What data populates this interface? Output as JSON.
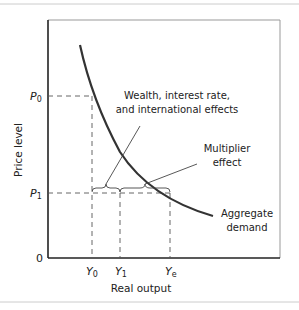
{
  "figure": {
    "y_axis_label": "Price level",
    "x_axis_label": "Real output",
    "origin_label": "0",
    "price_ticks": [
      {
        "main": "P",
        "sub": "0"
      },
      {
        "main": "P",
        "sub": "1"
      }
    ],
    "output_ticks": [
      {
        "main": "Y",
        "sub": "0"
      },
      {
        "main": "Y",
        "sub": "1"
      },
      {
        "main": "Y",
        "sub": "e"
      }
    ],
    "annotations": {
      "wealth_line1": "Wealth, interest rate,",
      "wealth_line2": "and international effects",
      "multiplier_line1": "Multiplier",
      "multiplier_line2": "effect",
      "curve_line1": "Aggregate",
      "curve_line2": "demand"
    },
    "colors": {
      "curve": "#333333",
      "axis": "#222222",
      "dashed": "#555555",
      "frame": "#bbbbbb"
    }
  }
}
